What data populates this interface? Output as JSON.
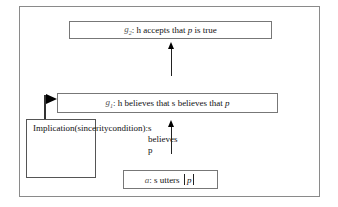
{
  "diagram": {
    "goal2": {
      "label": "g",
      "subscript": "2",
      "text": ": h accepts that ",
      "var": "p",
      "text_after": " is true"
    },
    "goal1": {
      "label": "g",
      "subscript": "1",
      "text": ": h believes that s believes that ",
      "var": "p"
    },
    "action": {
      "label": "a",
      "text": ": s utters ",
      "var": "p"
    },
    "implication": {
      "lines": [
        "Implication",
        "(sincerity",
        "condition):",
        "s believes p"
      ]
    },
    "arrows": [
      {
        "from": "action",
        "to": "goal1"
      },
      {
        "from": "goal1",
        "to": "goal2"
      }
    ],
    "flag": {
      "from": "implication",
      "to": "goal1"
    }
  }
}
